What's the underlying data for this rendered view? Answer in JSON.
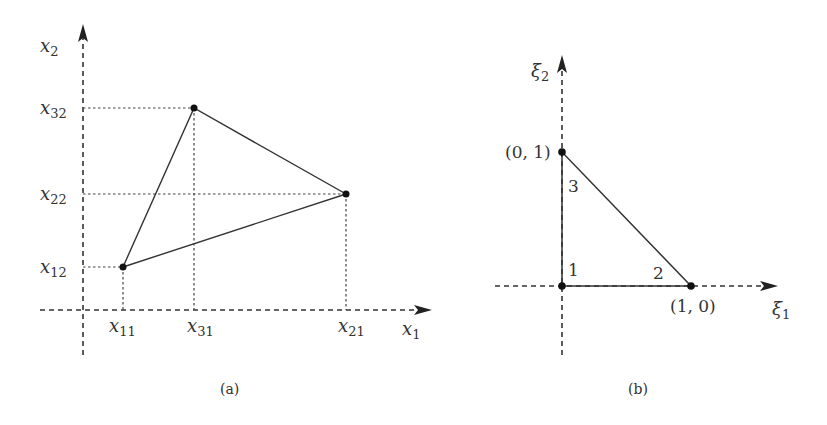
{
  "figure_a": {
    "caption": "(a)",
    "x_axis_label": "x",
    "x_axis_sub": "1",
    "y_axis_label": "x",
    "y_axis_sub": "2",
    "ticks_x": [
      {
        "base": "x",
        "sub": "11"
      },
      {
        "base": "x",
        "sub": "31"
      },
      {
        "base": "x",
        "sub": "21"
      }
    ],
    "ticks_y": [
      {
        "base": "x",
        "sub": "32"
      },
      {
        "base": "x",
        "sub": "22"
      },
      {
        "base": "x",
        "sub": "12"
      }
    ],
    "vertices": [
      {
        "name": "node-1",
        "coords": "(x11, x12)"
      },
      {
        "name": "node-2",
        "coords": "(x21, x22)"
      },
      {
        "name": "node-3",
        "coords": "(x31, x32)"
      }
    ]
  },
  "figure_b": {
    "caption": "(b)",
    "x_axis_label": "ξ",
    "x_axis_sub": "1",
    "y_axis_label": "ξ",
    "y_axis_sub": "2",
    "point_top": "(0, 1)",
    "point_right": "(1, 0)",
    "node_labels": [
      "1",
      "2",
      "3"
    ]
  }
}
